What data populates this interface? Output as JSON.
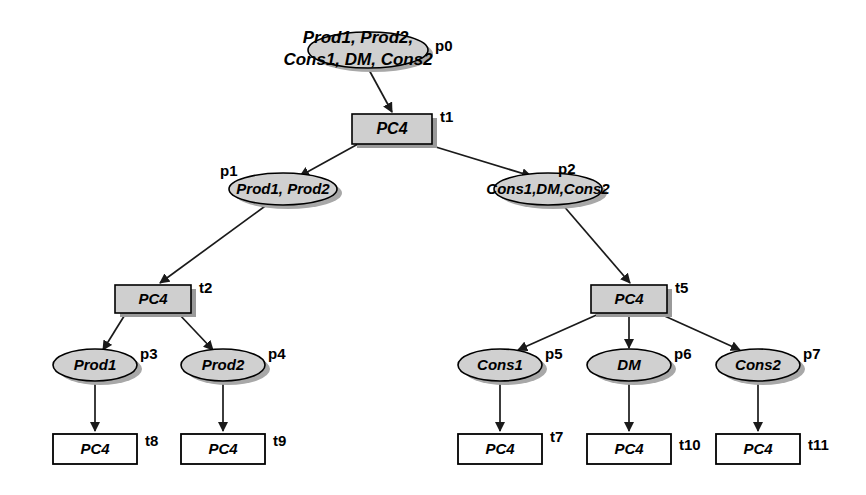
{
  "diagram": {
    "colors": {
      "place_fill": "#d0d0d0",
      "transition_fill": "#cfcfcf",
      "leaf_fill": "#ffffff",
      "stroke": "#000000",
      "shadow": "#a8a8a8"
    },
    "nodes": [
      {
        "id": "p0",
        "kind": "place",
        "label": "Prod1, Prod2,\nCons1, DM, Cons2",
        "label_line1": "Prod1, Prod2,",
        "label_line2": "Cons1, DM, Cons2",
        "id_label": "p0",
        "cx": 368,
        "cy": 50,
        "rx": 60,
        "ry": 18,
        "font_size": 17,
        "id_x": 435,
        "id_y": 47,
        "multiline": true
      },
      {
        "id": "t1",
        "kind": "transition",
        "label": "PC4",
        "id_label": "t1",
        "x": 352,
        "y": 114,
        "w": 80,
        "h": 30,
        "font_size": 16,
        "id_x": 440,
        "id_y": 118,
        "fill": "#cfcfcf"
      },
      {
        "id": "p1",
        "kind": "place",
        "label": "Prod1, Prod2",
        "id_label": "p1",
        "cx": 283,
        "cy": 189,
        "rx": 54,
        "ry": 16,
        "font_size": 15,
        "id_x": 220,
        "id_y": 172
      },
      {
        "id": "p2",
        "kind": "place",
        "label": "Cons1,DM,Cons2",
        "id_label": "p2",
        "cx": 548,
        "cy": 189,
        "rx": 54,
        "ry": 16,
        "font_size": 15,
        "id_x": 558,
        "id_y": 170
      },
      {
        "id": "t2",
        "kind": "transition",
        "label": "PC4",
        "id_label": "t2",
        "x": 115,
        "y": 285,
        "w": 76,
        "h": 28,
        "font_size": 15,
        "id_x": 199,
        "id_y": 289,
        "fill": "#cfcfcf"
      },
      {
        "id": "t5",
        "kind": "transition",
        "label": "PC4",
        "id_label": "t5",
        "x": 591,
        "y": 285,
        "w": 76,
        "h": 28,
        "font_size": 15,
        "id_x": 675,
        "id_y": 289,
        "fill": "#cfcfcf"
      },
      {
        "id": "p3",
        "kind": "place",
        "label": "Prod1",
        "id_label": "p3",
        "cx": 95,
        "cy": 365,
        "rx": 42,
        "ry": 16,
        "font_size": 15,
        "id_x": 140,
        "id_y": 355
      },
      {
        "id": "p4",
        "kind": "place",
        "label": "Prod2",
        "id_label": "p4",
        "cx": 223,
        "cy": 365,
        "rx": 42,
        "ry": 16,
        "font_size": 15,
        "id_x": 268,
        "id_y": 355
      },
      {
        "id": "p5",
        "kind": "place",
        "label": "Cons1",
        "id_label": "p5",
        "cx": 500,
        "cy": 365,
        "rx": 42,
        "ry": 16,
        "font_size": 15,
        "id_x": 545,
        "id_y": 355
      },
      {
        "id": "p6",
        "kind": "place",
        "label": "DM",
        "id_label": "p6",
        "cx": 629,
        "cy": 365,
        "rx": 42,
        "ry": 16,
        "font_size": 15,
        "id_x": 674,
        "id_y": 355
      },
      {
        "id": "p7",
        "kind": "place",
        "label": "Cons2",
        "id_label": "p7",
        "cx": 758,
        "cy": 365,
        "rx": 42,
        "ry": 16,
        "font_size": 15,
        "id_x": 803,
        "id_y": 355
      },
      {
        "id": "t8",
        "kind": "transition",
        "label": "PC4",
        "id_label": "t8",
        "x": 53,
        "y": 434,
        "w": 84,
        "h": 30,
        "font_size": 15,
        "id_x": 145,
        "id_y": 442,
        "fill": "#ffffff"
      },
      {
        "id": "t9",
        "kind": "transition",
        "label": "PC4",
        "id_label": "t9",
        "x": 181,
        "y": 434,
        "w": 84,
        "h": 30,
        "font_size": 15,
        "id_x": 273,
        "id_y": 442,
        "fill": "#ffffff"
      },
      {
        "id": "t7",
        "kind": "transition",
        "label": "PC4",
        "id_label": "t7",
        "x": 458,
        "y": 434,
        "w": 84,
        "h": 30,
        "font_size": 15,
        "id_x": 550,
        "id_y": 438,
        "fill": "#ffffff"
      },
      {
        "id": "t10",
        "kind": "transition",
        "label": "PC4",
        "id_label": "t10",
        "x": 587,
        "y": 434,
        "w": 84,
        "h": 30,
        "font_size": 15,
        "id_x": 679,
        "id_y": 446,
        "fill": "#ffffff"
      },
      {
        "id": "t11",
        "kind": "transition",
        "label": "PC4",
        "id_label": "t11",
        "x": 716,
        "y": 434,
        "w": 84,
        "h": 30,
        "font_size": 15,
        "id_x": 808,
        "id_y": 446,
        "fill": "#ffffff"
      }
    ],
    "edges": [
      {
        "from": "p0",
        "to": "t1",
        "x1": 368,
        "y1": 68,
        "x2": 392,
        "y2": 112
      },
      {
        "from": "t1",
        "to": "p1",
        "x1": 358,
        "y1": 144,
        "x2": 300,
        "y2": 176
      },
      {
        "from": "t1",
        "to": "p2",
        "x1": 426,
        "y1": 144,
        "x2": 531,
        "y2": 176
      },
      {
        "from": "p1",
        "to": "t2",
        "x1": 268,
        "y1": 204,
        "x2": 160,
        "y2": 283
      },
      {
        "from": "p2",
        "to": "t5",
        "x1": 562,
        "y1": 204,
        "x2": 630,
        "y2": 283
      },
      {
        "from": "t2",
        "to": "p3",
        "x1": 126,
        "y1": 313,
        "x2": 103,
        "y2": 350
      },
      {
        "from": "t2",
        "to": "p4",
        "x1": 178,
        "y1": 313,
        "x2": 213,
        "y2": 350
      },
      {
        "from": "t5",
        "to": "p5",
        "x1": 601,
        "y1": 313,
        "x2": 518,
        "y2": 350
      },
      {
        "from": "t5",
        "to": "p6",
        "x1": 629,
        "y1": 313,
        "x2": 629,
        "y2": 348
      },
      {
        "from": "t5",
        "to": "p7",
        "x1": 658,
        "y1": 313,
        "x2": 740,
        "y2": 350
      },
      {
        "from": "p3",
        "to": "t8",
        "x1": 95,
        "y1": 381,
        "x2": 95,
        "y2": 431
      },
      {
        "from": "p4",
        "to": "t9",
        "x1": 223,
        "y1": 381,
        "x2": 223,
        "y2": 431
      },
      {
        "from": "p5",
        "to": "t7",
        "x1": 500,
        "y1": 381,
        "x2": 500,
        "y2": 431
      },
      {
        "from": "p6",
        "to": "t10",
        "x1": 629,
        "y1": 381,
        "x2": 629,
        "y2": 431
      },
      {
        "from": "p7",
        "to": "t11",
        "x1": 758,
        "y1": 381,
        "x2": 758,
        "y2": 431
      }
    ]
  }
}
